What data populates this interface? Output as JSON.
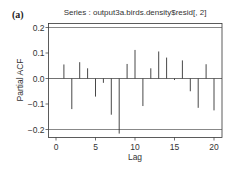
{
  "panel_label": "(a)",
  "chart_data": {
    "type": "bar",
    "subtype": "partial-acf-spike",
    "title": "Series : output3a.birds.density$resid[, 2]",
    "xlabel": "Lag",
    "ylabel": "Partial ACF",
    "x": [
      1,
      2,
      3,
      4,
      5,
      6,
      7,
      8,
      9,
      10,
      11,
      12,
      13,
      14,
      15,
      16,
      17,
      18,
      19,
      20
    ],
    "values": [
      0.055,
      -0.12,
      0.064,
      0.04,
      -0.071,
      -0.017,
      -0.142,
      -0.216,
      0.057,
      0.112,
      -0.108,
      0.04,
      0.106,
      0.082,
      -0.006,
      0.071,
      -0.05,
      -0.115,
      0.056,
      -0.125
    ],
    "confidence_bounds": [
      0.2,
      -0.2
    ],
    "xlim": [
      -0.9,
      20.9
    ],
    "ylim": [
      -0.23,
      0.215
    ],
    "xticks": [
      0,
      5,
      10,
      15,
      20
    ],
    "xtick_labels": [
      "0",
      "5",
      "10",
      "15",
      "20"
    ],
    "yticks": [
      0.2,
      0.1,
      0.0,
      -0.1,
      -0.2
    ],
    "ytick_labels": [
      "0.2",
      "0.1",
      "0.0",
      "−0.1",
      "−0.2"
    ],
    "grid": false,
    "legend": null,
    "colors": {
      "spike": "#333333",
      "axis": "#333333",
      "bound": "#555555"
    }
  }
}
